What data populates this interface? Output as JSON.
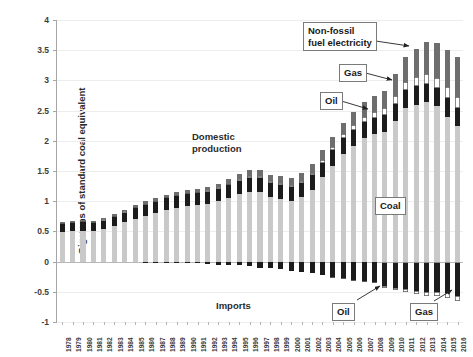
{
  "chart_data": {
    "type": "bar",
    "stacked": true,
    "title": "",
    "xlabel": "",
    "ylabel": "Gigatons of standard coal equivalent",
    "ylim": [
      -1,
      4
    ],
    "ytick_values": [
      -1,
      -0.5,
      0,
      0.5,
      1,
      1.5,
      2,
      2.5,
      3,
      3.5,
      4
    ],
    "ytick_labels": [
      "-1",
      "-0.5",
      "0",
      "0.5",
      "1",
      "1.5",
      "2",
      "2.5",
      "3",
      "3.5",
      "4"
    ],
    "grid": true,
    "legend_position": "none",
    "categories": [
      "1978",
      "1979",
      "1980",
      "1981",
      "1982",
      "1983",
      "1984",
      "1985",
      "1986",
      "1987",
      "1988",
      "1989",
      "1990",
      "1991",
      "1992",
      "1993",
      "1994",
      "1995",
      "1996",
      "1997",
      "1998",
      "1999",
      "2000",
      "2001",
      "2002",
      "2003",
      "2004",
      "2005",
      "2006",
      "2007",
      "2008",
      "2009",
      "2010",
      "2011",
      "2012",
      "2013",
      "2014",
      "2015",
      "2016"
    ],
    "series": [
      {
        "name": "Coal",
        "group": "Domestic production",
        "color": "#c9c9c9",
        "values": [
          0.49,
          0.5,
          0.5,
          0.5,
          0.54,
          0.59,
          0.65,
          0.71,
          0.75,
          0.8,
          0.85,
          0.89,
          0.92,
          0.93,
          0.96,
          1.0,
          1.06,
          1.12,
          1.16,
          1.15,
          1.07,
          1.04,
          1.0,
          1.07,
          1.19,
          1.4,
          1.59,
          1.78,
          1.92,
          2.04,
          2.11,
          2.15,
          2.32,
          2.55,
          2.6,
          2.64,
          2.57,
          2.4,
          2.25
        ]
      },
      {
        "name": "Oil",
        "group": "Domestic production",
        "color": "#1c1c1c",
        "values": [
          0.13,
          0.14,
          0.15,
          0.14,
          0.14,
          0.15,
          0.16,
          0.18,
          0.19,
          0.19,
          0.2,
          0.2,
          0.2,
          0.2,
          0.2,
          0.21,
          0.21,
          0.22,
          0.23,
          0.23,
          0.23,
          0.23,
          0.23,
          0.23,
          0.24,
          0.24,
          0.25,
          0.26,
          0.26,
          0.27,
          0.27,
          0.28,
          0.29,
          0.29,
          0.3,
          0.3,
          0.3,
          0.31,
          0.29
        ]
      },
      {
        "name": "Gas",
        "group": "Domestic production",
        "color": "#ffffff",
        "values": [
          0.02,
          0.02,
          0.02,
          0.02,
          0.02,
          0.02,
          0.02,
          0.02,
          0.02,
          0.02,
          0.02,
          0.02,
          0.02,
          0.02,
          0.02,
          0.02,
          0.02,
          0.03,
          0.03,
          0.03,
          0.03,
          0.03,
          0.04,
          0.04,
          0.04,
          0.05,
          0.06,
          0.07,
          0.08,
          0.09,
          0.1,
          0.11,
          0.13,
          0.14,
          0.15,
          0.16,
          0.17,
          0.18,
          0.19
        ]
      },
      {
        "name": "Non-fossil fuel electricity",
        "group": "Domestic production",
        "color": "#6e6e6e",
        "values": [
          0.02,
          0.02,
          0.02,
          0.02,
          0.02,
          0.03,
          0.03,
          0.03,
          0.04,
          0.04,
          0.04,
          0.05,
          0.05,
          0.05,
          0.06,
          0.06,
          0.07,
          0.08,
          0.09,
          0.1,
          0.1,
          0.11,
          0.12,
          0.13,
          0.14,
          0.15,
          0.17,
          0.19,
          0.21,
          0.24,
          0.26,
          0.29,
          0.36,
          0.41,
          0.47,
          0.53,
          0.58,
          0.62,
          0.66
        ]
      },
      {
        "name": "Oil",
        "group": "Imports",
        "color": "#1c1c1c",
        "values": [
          0.0,
          0.0,
          0.0,
          0.0,
          0.0,
          0.0,
          0.0,
          0.0,
          -0.01,
          -0.01,
          -0.02,
          -0.02,
          -0.02,
          -0.03,
          -0.04,
          -0.05,
          -0.05,
          -0.06,
          -0.08,
          -0.1,
          -0.1,
          -0.12,
          -0.16,
          -0.17,
          -0.19,
          -0.22,
          -0.26,
          -0.27,
          -0.3,
          -0.32,
          -0.33,
          -0.38,
          -0.41,
          -0.43,
          -0.45,
          -0.47,
          -0.47,
          -0.5,
          -0.55
        ]
      },
      {
        "name": "Gas",
        "group": "Imports",
        "color": "#ffffff",
        "values": [
          0.0,
          0.0,
          0.0,
          0.0,
          0.0,
          0.0,
          0.0,
          0.0,
          0.0,
          0.0,
          0.0,
          0.0,
          0.0,
          0.0,
          0.0,
          0.0,
          0.0,
          0.0,
          0.0,
          0.0,
          0.0,
          0.0,
          0.0,
          0.0,
          0.0,
          0.0,
          -0.01,
          -0.01,
          -0.02,
          -0.02,
          -0.03,
          -0.03,
          -0.04,
          -0.05,
          -0.06,
          -0.07,
          -0.07,
          -0.08,
          -0.09
        ]
      },
      {
        "name": "Coal",
        "group": "Imports",
        "color": "#8a8a8a",
        "values": [
          0.0,
          0.0,
          0.0,
          0.0,
          0.0,
          0.0,
          0.0,
          0.0,
          0.0,
          0.0,
          0.0,
          0.0,
          0.0,
          0.0,
          0.0,
          0.0,
          0.0,
          0.0,
          0.0,
          0.0,
          0.0,
          0.0,
          0.0,
          0.0,
          0.0,
          0.0,
          0.0,
          0.0,
          0.0,
          0.0,
          0.0,
          -0.02,
          -0.02,
          -0.03,
          -0.03,
          -0.03,
          -0.03,
          -0.02,
          -0.02
        ]
      }
    ],
    "annotations": [
      {
        "name": "domestic-production",
        "text": "Domestic\nproduction",
        "boxed": false,
        "x": 192,
        "y": 131
      },
      {
        "name": "imports",
        "text": "Imports",
        "boxed": false,
        "x": 216,
        "y": 300
      },
      {
        "name": "non-fossil-fuel-electricity",
        "text": "Non-fossil\nfuel electricity",
        "boxed": true,
        "x": 303,
        "y": 22
      },
      {
        "name": "gas-upper",
        "text": "Gas",
        "boxed": true,
        "x": 339,
        "y": 64
      },
      {
        "name": "oil-upper",
        "text": "Oil",
        "boxed": true,
        "x": 320,
        "y": 92
      },
      {
        "name": "coal",
        "text": "Coal",
        "boxed": true,
        "x": 375,
        "y": 197
      },
      {
        "name": "oil-lower",
        "text": "Oil",
        "boxed": true,
        "x": 332,
        "y": 303
      },
      {
        "name": "gas-lower",
        "text": "Gas",
        "boxed": true,
        "x": 410,
        "y": 303
      }
    ]
  }
}
